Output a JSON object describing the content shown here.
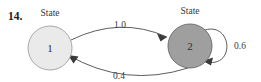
{
  "figure": {
    "exercise_number": "14.",
    "background_color": "#ffffff"
  },
  "nodes": [
    {
      "id": "state-1",
      "caption": "State",
      "label": "1",
      "cx": 50,
      "cy": 48,
      "r": 22,
      "fill": "#eaeaea",
      "stroke": "#a8a8a8",
      "caption_x": 50,
      "caption_y": 16
    },
    {
      "id": "state-2",
      "caption": "State",
      "label": "2",
      "cx": 190,
      "cy": 46,
      "r": 22,
      "fill": "#9f9f9f",
      "stroke": "#6f6f6f",
      "caption_x": 190,
      "caption_y": 14
    }
  ],
  "edges": [
    {
      "id": "edge-1-to-2",
      "from": "state-1",
      "to": "state-2",
      "label": "1.0",
      "label_x": 120,
      "label_y": 28,
      "direction": "left-to-right"
    },
    {
      "id": "edge-2-to-1",
      "from": "state-2",
      "to": "state-1",
      "label": "0.4",
      "label_x": 119,
      "label_y": 76,
      "direction": "right-to-left"
    },
    {
      "id": "edge-2-self-loop",
      "from": "state-2",
      "to": "state-2",
      "label": "0.6",
      "label_x": 240,
      "label_y": 47,
      "direction": "self-loop"
    }
  ],
  "colors": {
    "stroke": "#4a4a4a",
    "text": "#3a3a3a",
    "state1_fill": "#eaeaea",
    "state2_fill": "#9f9f9f"
  }
}
